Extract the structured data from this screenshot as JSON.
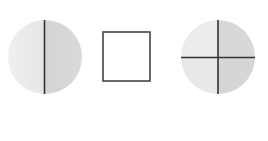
{
  "figure": {
    "shapes": [
      {
        "name": "circle-halves",
        "divisions": 2,
        "fill_light": "#ebebeb",
        "fill_dark": "#d6d6d6"
      },
      {
        "name": "square",
        "divisions": 1,
        "fill": "#ffffff"
      },
      {
        "name": "circle-quarters",
        "divisions": 4,
        "fill_light": "#ebebeb",
        "fill_dark": "#d6d6d6"
      }
    ],
    "colors": {
      "line": "#333333",
      "background": "#ffffff"
    }
  }
}
